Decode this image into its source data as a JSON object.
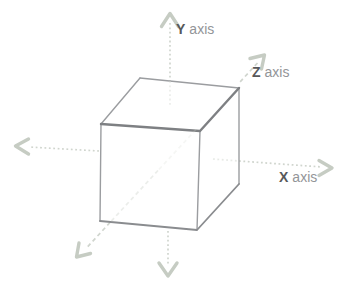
{
  "diagram": {
    "type": "3d-cube-axes",
    "labels": {
      "y": {
        "letter": "Y",
        "word": "axis"
      },
      "z": {
        "letter": "Z",
        "word": "axis"
      },
      "x": {
        "letter": "X",
        "word": "axis"
      }
    }
  },
  "colors": {
    "c-bg": "#ffffff",
    "c-axis": "#d0d5ce",
    "c-arrow": "#c6ccc3",
    "c-edge": "#9b9da0",
    "c-edge-strong": "#7e8083",
    "c-edge-bottom": "#8a8c8f",
    "c-face": "#ffffff",
    "c-letter": "#57585a",
    "c-word": "#939598"
  }
}
